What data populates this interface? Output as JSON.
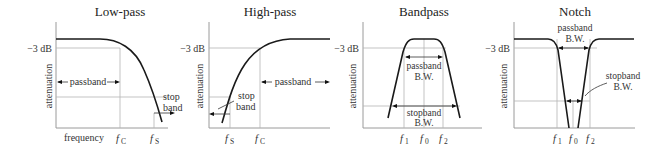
{
  "panels": [
    {
      "title": "Low-pass",
      "db_label": "−3 dB",
      "ylabel": "attenuation",
      "xlabel": "frequency",
      "passband_label": "passband",
      "stopband_label_1": "stop",
      "stopband_label_2": "band",
      "ticks": [
        {
          "f": "f",
          "sub": "C"
        },
        {
          "f": "f",
          "sub": "S"
        }
      ]
    },
    {
      "title": "High-pass",
      "db_label": "−3 dB",
      "ylabel": "attenuation",
      "passband_label": "passband",
      "stopband_label_1": "stop",
      "stopband_label_2": "band",
      "ticks": [
        {
          "f": "f",
          "sub": "S"
        },
        {
          "f": "f",
          "sub": "C"
        }
      ]
    },
    {
      "title": "Bandpass",
      "db_label": "−3 dB",
      "ylabel": "attenuation",
      "passband_label_1": "passband",
      "passband_label_2": "B.W.",
      "stopband_label_1": "stopband",
      "stopband_label_2": "B.W.",
      "ticks": [
        {
          "f": "f",
          "sub": "1"
        },
        {
          "f": "f",
          "sub": "0"
        },
        {
          "f": "f",
          "sub": "2"
        }
      ]
    },
    {
      "title": "Notch",
      "db_label": "−3 dB",
      "ylabel": "attenuation",
      "passband_label_1": "passband",
      "passband_label_2": "B.W.",
      "stopband_label_1": "stopband",
      "stopband_label_2": "B.W.",
      "ticks": [
        {
          "f": "f",
          "sub": "1"
        },
        {
          "f": "f",
          "sub": "0"
        },
        {
          "f": "f",
          "sub": "2"
        }
      ]
    }
  ]
}
